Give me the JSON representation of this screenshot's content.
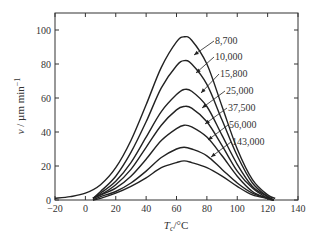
{
  "chart_data": {
    "type": "line",
    "title": "",
    "xlabel": "T_c/°C",
    "ylabel": "v / µm min^-1",
    "xlim": [
      -20,
      140
    ],
    "ylim": [
      0,
      110
    ],
    "xticks": [
      -20,
      0,
      20,
      40,
      60,
      80,
      100,
      120,
      140
    ],
    "yticks": [
      0,
      20,
      40,
      60,
      80,
      100
    ],
    "grid": false,
    "legend_position": "inline labels with arrows, right of curves",
    "series": [
      {
        "name": "8,700",
        "x": [
          -20,
          -10,
          0,
          10,
          20,
          30,
          40,
          50,
          60,
          65,
          70,
          80,
          90,
          100,
          110,
          120,
          125
        ],
        "y": [
          1,
          2,
          4,
          9,
          19,
          35,
          56,
          78,
          93,
          96,
          94,
          80,
          55,
          30,
          12,
          3,
          1
        ]
      },
      {
        "name": "10,000",
        "x": [
          5,
          10,
          20,
          30,
          40,
          50,
          60,
          65,
          70,
          80,
          90,
          100,
          110,
          120,
          124
        ],
        "y": [
          1,
          5,
          14,
          28,
          46,
          66,
          79,
          82,
          80,
          68,
          47,
          26,
          10,
          2,
          0
        ]
      },
      {
        "name": "15,800",
        "x": [
          5,
          10,
          20,
          30,
          40,
          50,
          60,
          65,
          70,
          80,
          90,
          100,
          110,
          120,
          124
        ],
        "y": [
          1,
          4,
          11,
          22,
          37,
          52,
          62,
          65,
          64,
          55,
          38,
          21,
          8,
          2,
          0
        ]
      },
      {
        "name": "25,000",
        "x": [
          5,
          10,
          20,
          30,
          40,
          50,
          60,
          65,
          70,
          80,
          90,
          100,
          110,
          120,
          124
        ],
        "y": [
          1,
          3,
          9,
          18,
          31,
          44,
          53,
          55,
          54,
          46,
          32,
          17,
          7,
          1,
          0
        ]
      },
      {
        "name": "37,500",
        "x": [
          5,
          10,
          20,
          30,
          40,
          50,
          60,
          65,
          70,
          80,
          90,
          100,
          110,
          120,
          124
        ],
        "y": [
          1,
          3,
          7,
          14,
          24,
          35,
          42,
          44,
          43,
          37,
          26,
          14,
          5,
          1,
          0
        ]
      },
      {
        "name": "56,000",
        "x": [
          5,
          10,
          20,
          30,
          40,
          50,
          60,
          65,
          70,
          80,
          90,
          100,
          110,
          120,
          124
        ],
        "y": [
          0,
          2,
          5,
          10,
          17,
          25,
          30,
          31,
          30,
          26,
          18,
          10,
          4,
          1,
          0
        ]
      },
      {
        "name": "143,000",
        "x": [
          5,
          10,
          20,
          30,
          40,
          50,
          60,
          65,
          70,
          80,
          90,
          100,
          110,
          120,
          124
        ],
        "y": [
          0,
          1,
          4,
          8,
          13,
          19,
          22,
          23,
          22,
          19,
          14,
          8,
          3,
          1,
          0
        ]
      }
    ]
  },
  "labels": {
    "y_axis_main": "v",
    "y_axis_unit": " / µm min",
    "y_axis_exp": "−1",
    "x_axis_main": "T",
    "x_axis_sub": "c",
    "x_axis_unit": "/°C",
    "series_labels": [
      "8,700",
      "10,000",
      "15,800",
      "25,000",
      "37,500",
      "56,000",
      "143,000"
    ],
    "xtick_labels": [
      "−20",
      "0",
      "20",
      "40",
      "60",
      "80",
      "100",
      "120",
      "140"
    ],
    "ytick_labels": [
      "0",
      "20",
      "40",
      "60",
      "80",
      "100"
    ]
  }
}
